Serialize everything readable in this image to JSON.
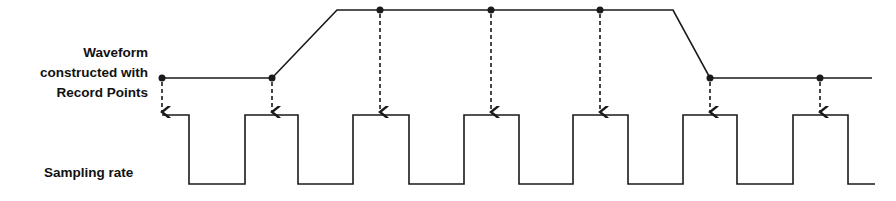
{
  "labels": {
    "waveform_line1": "Waveform",
    "waveform_line2": "constructed with",
    "waveform_line3": "Record Points",
    "sampling": "Sampling rate"
  },
  "colors": {
    "line": "#1a1a1a",
    "background": "#ffffff"
  },
  "waveform": {
    "points": [
      [
        162,
        78
      ],
      [
        272,
        78
      ],
      [
        337,
        10
      ],
      [
        673,
        10
      ],
      [
        710,
        78
      ],
      [
        872,
        78
      ]
    ],
    "record_points": [
      [
        162,
        78
      ],
      [
        272,
        78
      ],
      [
        380,
        10
      ],
      [
        491,
        10
      ],
      [
        600,
        10
      ],
      [
        710,
        78
      ],
      [
        820,
        78
      ]
    ]
  },
  "sampling_signal": {
    "high_y": 115,
    "low_y": 184,
    "edges_x": [
      162,
      189,
      245,
      298,
      353,
      409,
      464,
      519,
      573,
      628,
      683,
      737,
      793,
      848,
      875
    ]
  }
}
